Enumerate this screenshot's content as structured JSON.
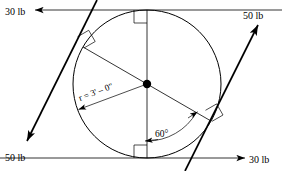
{
  "figure": {
    "type": "engineering-statics-free-body-diagram",
    "background_color": "#ffffff",
    "line_color": "#000000"
  },
  "geometry": {
    "center": {
      "x": 147,
      "y": 84
    },
    "radius_px": 74,
    "circle_top": {
      "x": 147,
      "y": 10
    },
    "circle_bottom": {
      "x": 147,
      "y": 158
    },
    "vertical_diameter": {
      "from": {
        "x": 147,
        "y": 10
      },
      "to": {
        "x": 147,
        "y": 158
      }
    },
    "inclined_diameter_angle_deg": 60,
    "inclined_diameter": {
      "from": {
        "x": 83,
        "y": 47
      },
      "to": {
        "x": 211,
        "y": 121
      }
    }
  },
  "forces": [
    {
      "id": "force-top-left",
      "label": "30 lb",
      "magnitude": 30,
      "unit": "lb",
      "direction": "left",
      "line_weight": "thin",
      "tail": {
        "x": 282,
        "y": 10
      },
      "head": {
        "x": 35,
        "y": 10
      },
      "label_pos": {
        "x": 5,
        "y": 14
      }
    },
    {
      "id": "force-bottom-right",
      "label": "30 lb",
      "magnitude": 30,
      "unit": "lb",
      "direction": "right",
      "line_weight": "thin",
      "tail": {
        "x": 0,
        "y": 158
      },
      "head": {
        "x": 245,
        "y": 158
      },
      "label_pos": {
        "x": 249,
        "y": 162
      }
    },
    {
      "id": "force-lower-left",
      "label": "50 lb",
      "magnitude": 50,
      "unit": "lb",
      "direction": "down-left",
      "line_weight": "thick",
      "tail": {
        "x": 97,
        "y": 0
      },
      "head": {
        "x": 27,
        "y": 141
      },
      "label_pos": {
        "x": 5,
        "y": 160
      }
    },
    {
      "id": "force-upper-right",
      "label": "50 lb",
      "magnitude": 50,
      "unit": "lb",
      "direction": "up-right",
      "line_weight": "thick",
      "tail": {
        "x": 185,
        "y": 171
      },
      "head": {
        "x": 258,
        "y": 25
      },
      "label_pos": {
        "x": 243,
        "y": 18
      }
    }
  ],
  "dimensions": {
    "radius_label": "r = 3' – 0\"",
    "radius_label_pos": {
      "x": 78,
      "y": 98
    },
    "radius_label_rotation_deg": -30
  },
  "angles": [
    {
      "id": "angle-60",
      "label": "60°",
      "value_deg": 60,
      "label_pos": {
        "x": 155,
        "y": 135
      },
      "between": [
        "vertical-radius-down",
        "inclined-radius-lower-right"
      ]
    }
  ],
  "right_angle_marks": [
    {
      "id": "right-angle-top",
      "at": {
        "x": 147,
        "y": 10
      }
    },
    {
      "id": "right-angle-bottom",
      "at": {
        "x": 147,
        "y": 158
      }
    },
    {
      "id": "right-angle-upper-left",
      "at": {
        "x": 83,
        "y": 47
      }
    },
    {
      "id": "right-angle-lower-right",
      "at": {
        "x": 211,
        "y": 121
      }
    }
  ]
}
